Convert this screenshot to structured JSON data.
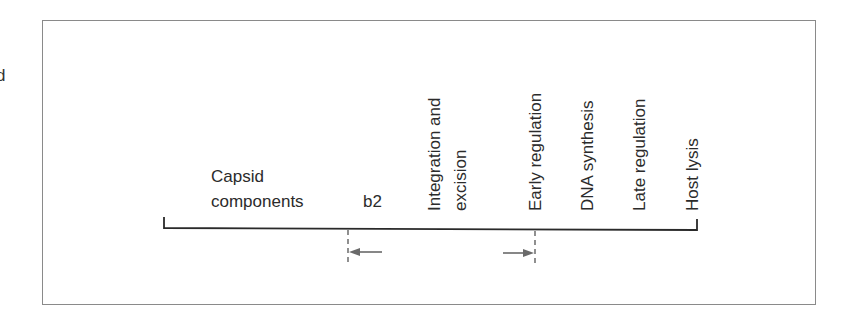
{
  "edge_fragment": "d",
  "diagram": {
    "title": "",
    "regions": [
      {
        "id": "capsid",
        "lines": [
          "Capsid",
          "components"
        ]
      },
      {
        "id": "b2",
        "lines": [
          "b2"
        ]
      },
      {
        "id": "integration",
        "lines": [
          "Integration and",
          "excision"
        ]
      },
      {
        "id": "early",
        "lines": [
          "Early regulation"
        ]
      },
      {
        "id": "dna",
        "lines": [
          "DNA synthesis"
        ]
      },
      {
        "id": "late",
        "lines": [
          "Late regulation"
        ]
      },
      {
        "id": "lysis",
        "lines": [
          "Host lysis"
        ]
      }
    ],
    "markers": [
      {
        "id": "left-boundary",
        "direction": "left"
      },
      {
        "id": "right-boundary",
        "direction": "right"
      }
    ],
    "colors": {
      "line": "#2a2a2a",
      "frame": "#8a8a8a",
      "arrow": "#6a6a6a"
    }
  }
}
